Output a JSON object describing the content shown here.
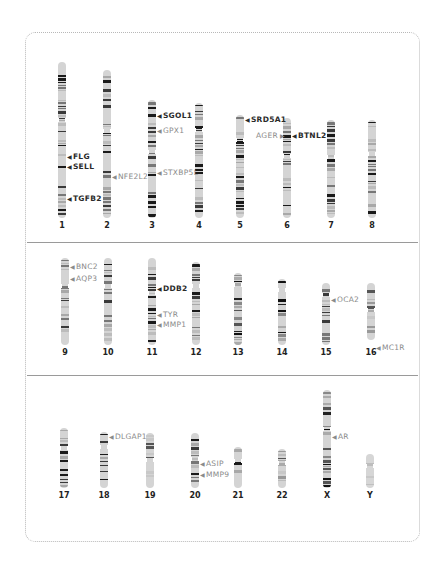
{
  "colors": {
    "frame": "#b8b8b8",
    "divider": "#9a9a9a",
    "band_dark": "#1a1a1a",
    "band_mid": "#6a6a6a",
    "band_light": "#c8c8c8",
    "gene_dark": "#2a2a2a",
    "gene_light": "#8a8a8a"
  },
  "rows": [
    {
      "chromosomes": [
        {
          "id": "1",
          "label": "1"
        },
        {
          "id": "2",
          "label": "2"
        },
        {
          "id": "3",
          "label": "3"
        },
        {
          "id": "4",
          "label": "4"
        },
        {
          "id": "5",
          "label": "5"
        },
        {
          "id": "6",
          "label": "6"
        },
        {
          "id": "7",
          "label": "7"
        },
        {
          "id": "8",
          "label": "8"
        }
      ]
    },
    {
      "chromosomes": [
        {
          "id": "9",
          "label": "9"
        },
        {
          "id": "10",
          "label": "10"
        },
        {
          "id": "11",
          "label": "11"
        },
        {
          "id": "12",
          "label": "12"
        },
        {
          "id": "13",
          "label": "13"
        },
        {
          "id": "14",
          "label": "14"
        },
        {
          "id": "15",
          "label": "15"
        },
        {
          "id": "16",
          "label": "16"
        }
      ]
    },
    {
      "chromosomes": [
        {
          "id": "17",
          "label": "17"
        },
        {
          "id": "18",
          "label": "18"
        },
        {
          "id": "19",
          "label": "19"
        },
        {
          "id": "20",
          "label": "20"
        },
        {
          "id": "21",
          "label": "21"
        },
        {
          "id": "22",
          "label": "22"
        },
        {
          "id": "X",
          "label": "X"
        },
        {
          "id": "Y",
          "label": "Y"
        }
      ]
    }
  ],
  "genes": [
    {
      "name": "FLG",
      "chromosome": "1",
      "style": "dark"
    },
    {
      "name": "SELL",
      "chromosome": "1",
      "style": "dark"
    },
    {
      "name": "TGFB2",
      "chromosome": "1",
      "style": "dark"
    },
    {
      "name": "NFE2L2",
      "chromosome": "2",
      "style": "light"
    },
    {
      "name": "SGOL1",
      "chromosome": "3",
      "style": "dark"
    },
    {
      "name": "GPX1",
      "chromosome": "3",
      "style": "light"
    },
    {
      "name": "STXBP5L",
      "chromosome": "3",
      "style": "light"
    },
    {
      "name": "SRD5A1",
      "chromosome": "5",
      "style": "dark"
    },
    {
      "name": "AGER",
      "chromosome": "6",
      "style": "light"
    },
    {
      "name": "BTNL2",
      "chromosome": "6",
      "style": "dark"
    },
    {
      "name": "BNC2",
      "chromosome": "9",
      "style": "light"
    },
    {
      "name": "AQP3",
      "chromosome": "9",
      "style": "dark"
    },
    {
      "name": "DDB2",
      "chromosome": "11",
      "style": "dark"
    },
    {
      "name": "TYR",
      "chromosome": "11",
      "style": "light"
    },
    {
      "name": "MMP1",
      "chromosome": "11",
      "style": "light"
    },
    {
      "name": "OCA2",
      "chromosome": "15",
      "style": "light"
    },
    {
      "name": "MC1R",
      "chromosome": "16",
      "style": "light"
    },
    {
      "name": "DLGAP1",
      "chromosome": "18",
      "style": "light"
    },
    {
      "name": "ASIP",
      "chromosome": "20",
      "style": "light"
    },
    {
      "name": "MMP9",
      "chromosome": "20",
      "style": "light"
    },
    {
      "name": "AR",
      "chromosome": "X",
      "style": "light"
    }
  ],
  "arrows": {
    "left": "◀",
    "right": "▶"
  }
}
